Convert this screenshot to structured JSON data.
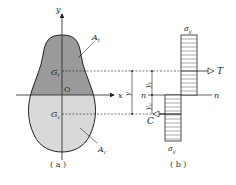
{
  "figure": {
    "panel_a": {
      "caption": "( a )",
      "axis_x_label": "x",
      "axis_y_label": "y",
      "origin_label": "O",
      "tension_area_label": "A",
      "tension_area_sub": "t",
      "compression_area_label": "A",
      "compression_area_sub": "c",
      "tension_centroid_label": "G",
      "tension_centroid_sub": "t",
      "compression_centroid_label": "G",
      "compression_centroid_sub": "c",
      "tension_fill": "#9a9a9a",
      "compression_fill": "#d9d9d9"
    },
    "panel_b": {
      "caption": "( b )",
      "neutral_axis_left": "n",
      "neutral_axis_right": "n",
      "stress_top_label": "σ",
      "stress_top_sub": "y",
      "stress_bottom_label": "σ",
      "stress_bottom_sub": "y",
      "tension_force_label": "T",
      "compression_force_label": "C",
      "lever_arm_label": "y",
      "dist_t_label": "y",
      "dist_t_sub": "t",
      "dist_c_label": "y",
      "dist_c_sub": "c"
    }
  }
}
